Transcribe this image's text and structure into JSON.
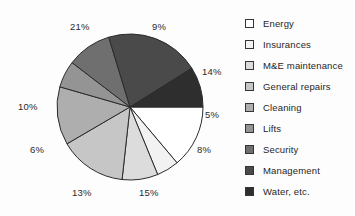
{
  "chart_data": {
    "type": "pie",
    "title": "",
    "subtitle": "",
    "xlabel": "",
    "ylabel": "",
    "legend_position": "right",
    "grid": false,
    "start_angle_deg": 0,
    "direction": "clockwise",
    "categories": [
      "Energy",
      "Insurances",
      "M&E maintenance",
      "General repairs",
      "Cleaning",
      "Lifts",
      "Security",
      "Management",
      "Water, etc."
    ],
    "values": [
      14,
      5,
      8,
      15,
      13,
      6,
      10,
      21,
      9
    ],
    "value_labels": [
      "14%",
      "5%",
      "8%",
      "15%",
      "13%",
      "6%",
      "10%",
      "21%",
      "9%"
    ],
    "colors": [
      "#ffffff",
      "#f2f2f2",
      "#dcdcdc",
      "#c6c6c6",
      "#aeaeae",
      "#949494",
      "#6f6f6f",
      "#4a4a4a",
      "#2e2e2e"
    ],
    "slice_border_color": "#2b2b2b",
    "total": 101,
    "units": "percent"
  },
  "pie": {
    "center_x": 130,
    "center_y": 107,
    "radius": 73,
    "slices": [
      {
        "name": "Energy",
        "label": "14%",
        "value": 14,
        "color": "#ffffff",
        "label_x": 202,
        "label_y": 67
      },
      {
        "name": "Insurances",
        "label": "5%",
        "value": 5,
        "color": "#f2f2f2",
        "label_x": 205,
        "label_y": 110
      },
      {
        "name": "M&E maintenance",
        "label": "8%",
        "value": 8,
        "color": "#dcdcdc",
        "label_x": 197,
        "label_y": 145
      },
      {
        "name": "General repairs",
        "label": "15%",
        "value": 15,
        "color": "#c6c6c6",
        "label_x": 139,
        "label_y": 188
      },
      {
        "name": "Cleaning",
        "label": "13%",
        "value": 13,
        "color": "#aeaeae",
        "label_x": 72,
        "label_y": 188
      },
      {
        "name": "Lifts",
        "label": "6%",
        "value": 6,
        "color": "#949494",
        "label_x": 30,
        "label_y": 145
      },
      {
        "name": "Security",
        "label": "10%",
        "value": 10,
        "color": "#6f6f6f",
        "label_x": 18,
        "label_y": 102
      },
      {
        "name": "Management",
        "label": "21%",
        "value": 21,
        "color": "#4a4a4a",
        "label_x": 70,
        "label_y": 22
      },
      {
        "name": "Water, etc.",
        "label": "9%",
        "value": 9,
        "color": "#2e2e2e",
        "label_x": 152,
        "label_y": 22
      }
    ]
  },
  "legend": {
    "items": [
      {
        "label": "Energy",
        "color": "#ffffff"
      },
      {
        "label": "Insurances",
        "color": "#f2f2f2"
      },
      {
        "label": "M&E maintenance",
        "color": "#dcdcdc"
      },
      {
        "label": "General repairs",
        "color": "#c6c6c6"
      },
      {
        "label": "Cleaning",
        "color": "#aeaeae"
      },
      {
        "label": "Lifts",
        "color": "#949494"
      },
      {
        "label": "Security",
        "color": "#6f6f6f"
      },
      {
        "label": "Management",
        "color": "#4a4a4a"
      },
      {
        "label": "Water, etc.",
        "color": "#2e2e2e"
      }
    ]
  }
}
